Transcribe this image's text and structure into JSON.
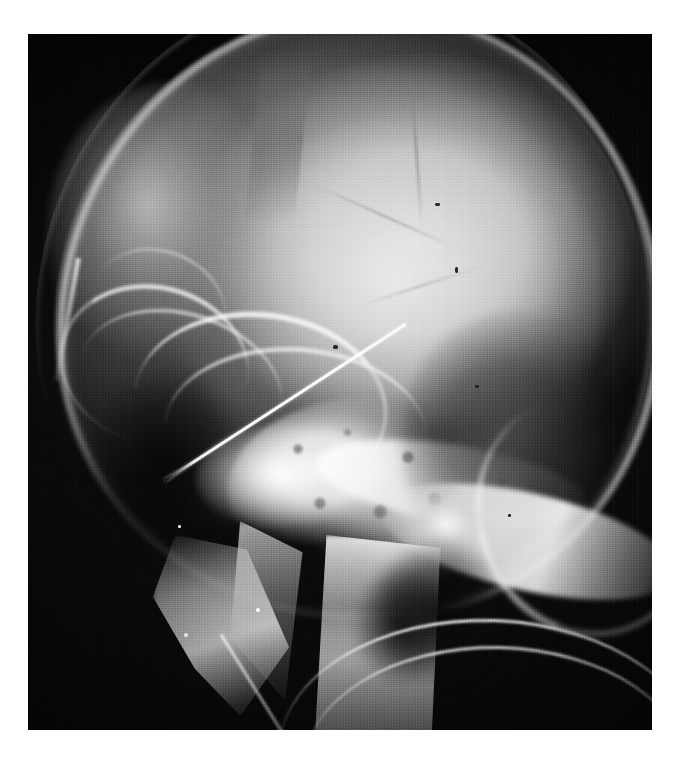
{
  "page": {
    "background_color": "#ffffff",
    "caption": ""
  },
  "radiograph": {
    "modality_label": "lateral-skull-radiograph",
    "orientation": "lateral",
    "film_bounds_px": {
      "x": 28,
      "y": 34,
      "width": 624,
      "height": 696
    },
    "background_color": "#070707",
    "bone_color": "#f4f4f4",
    "soft_tissue_color": "#8c8c8c",
    "air_color": "#0a0a0a",
    "grain": "heavy-halftone",
    "regions": [
      {
        "name": "cranial-vault",
        "label": "Cranial vault"
      },
      {
        "name": "calvarium",
        "label": "Calvarial outer table"
      },
      {
        "name": "scalp-outline",
        "label": "Scalp soft-tissue line"
      },
      {
        "name": "frontal-bone",
        "label": "Frontal bone"
      },
      {
        "name": "orbital-roof",
        "label": "Orbital roof"
      },
      {
        "name": "sphenoid-wing",
        "label": "Greater wing of sphenoid"
      },
      {
        "name": "orbit",
        "label": "Orbit"
      },
      {
        "name": "skull-base",
        "label": "Sclerotic skull base"
      },
      {
        "name": "petrous-ridge",
        "label": "Petrous ridge"
      },
      {
        "name": "mottled-lesion",
        "label": "Mottled trabecular pattern"
      },
      {
        "name": "occipital-bone",
        "label": "Occipital bone"
      },
      {
        "name": "posterior-fossa",
        "label": "Posterior fossa"
      },
      {
        "name": "mandibular-ramus",
        "label": "Mandibular ramus"
      },
      {
        "name": "condyle",
        "label": "Mandibular condyle"
      },
      {
        "name": "cervical-spine",
        "label": "Cervical spine"
      },
      {
        "name": "airway",
        "label": "Airway"
      }
    ],
    "artifacts": [
      {
        "name": "needle-artifact",
        "label": "Linear metallic needle",
        "appearance": "thin bright diagonal line"
      },
      {
        "name": "tube-artifact-upper",
        "label": "Curved radiopaque tube",
        "appearance": "bright curved arc"
      },
      {
        "name": "tube-artifact-lower",
        "label": "Curved radiopaque tube",
        "appearance": "bright curved arc"
      },
      {
        "name": "tube-artifact-cross",
        "label": "Crossing radiopaque tube",
        "appearance": "short bright oblique line"
      }
    ],
    "sutures": [
      {
        "name": "coronal-suture"
      },
      {
        "name": "lambdoid-suture"
      },
      {
        "name": "vascular-groove"
      }
    ],
    "bright_specks": [
      {
        "x_pct": 25.0,
        "y_pct": 86.0,
        "size": 4
      },
      {
        "x_pct": 36.5,
        "y_pct": 82.5,
        "size": 4
      },
      {
        "x_pct": 24.0,
        "y_pct": 70.5,
        "size": 3
      }
    ],
    "dark_specks": [
      {
        "x_pct": 65.2,
        "y_pct": 24.3,
        "w": 5,
        "h": 3
      },
      {
        "x_pct": 68.5,
        "y_pct": 33.5,
        "w": 3,
        "h": 6
      },
      {
        "x_pct": 48.9,
        "y_pct": 44.7,
        "w": 5,
        "h": 4
      },
      {
        "x_pct": 71.6,
        "y_pct": 50.4,
        "w": 4,
        "h": 3
      },
      {
        "x_pct": 77.0,
        "y_pct": 69.0,
        "w": 3,
        "h": 3
      }
    ]
  }
}
